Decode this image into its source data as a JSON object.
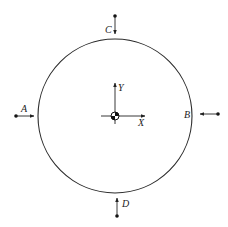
{
  "diagram": {
    "type": "free-body / force diagram on circular disk",
    "circle": {
      "cx": 115,
      "cy": 116,
      "r": 77,
      "stroke": "#2a2a2a"
    },
    "center_of_mass": {
      "x": 115,
      "y": 116,
      "symbol": "center-of-mass-icon"
    },
    "axes": {
      "x_label": "X",
      "y_label": "Y"
    },
    "points": [
      {
        "id": "A",
        "label": "A",
        "position": "left",
        "arrow_direction": "right"
      },
      {
        "id": "B",
        "label": "B",
        "position": "right",
        "arrow_direction": "left"
      },
      {
        "id": "C",
        "label": "C",
        "position": "top",
        "arrow_direction": "down"
      },
      {
        "id": "D",
        "label": "D",
        "position": "bottom",
        "arrow_direction": "up"
      }
    ]
  }
}
